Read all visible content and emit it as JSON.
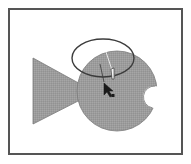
{
  "figure": {
    "description": "Fish illustration with an ellipse selection and a pointer cursor",
    "colors": {
      "frame_border": "#555555",
      "background": "#ffffff",
      "fish_fill": "#9c9c9c",
      "fish_stroke": "#7a7a7a",
      "ellipse_stroke": "#3c3c3c",
      "cursor": "#1a1a1a",
      "guide_line_light": "#e6e6e6",
      "guide_line_dark": "#3a3a3a"
    },
    "shapes": {
      "tail": {
        "name": "Tail",
        "points": "33,58 82,86 82,98 33,124"
      },
      "body": {
        "name": "Body",
        "cx": 117,
        "cy": 91,
        "r": 40
      },
      "mouth": {
        "name": "Mouth notch",
        "cx": 154,
        "cy": 97,
        "r": 11
      },
      "ellipse": {
        "name": "Ellipse",
        "cx": 103,
        "cy": 58,
        "rx": 31,
        "ry": 19
      }
    },
    "cursor": {
      "name": "Direct selection pointer",
      "tip_x": 104,
      "tip_y": 83
    }
  }
}
